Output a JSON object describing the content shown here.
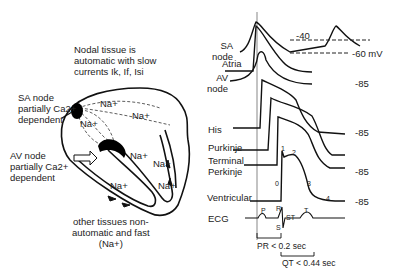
{
  "heart": {
    "nodal_note": [
      "Nodal tissue is",
      "automatic with slow",
      "currents Ik, If, Isi"
    ],
    "sa_label": [
      "SA node",
      "partially Ca2+",
      "dependent"
    ],
    "av_label": [
      "AV node",
      "partially Ca2+",
      "dependent"
    ],
    "na_labels": [
      "Na+",
      "Na+",
      "Na+",
      "Na+",
      "Na+",
      "Na+",
      "Na+"
    ],
    "other_note": [
      "other tissues non-",
      "automatic and fast",
      "(Na+)"
    ]
  },
  "traces": {
    "labels": {
      "sa": [
        "SA",
        "node"
      ],
      "atria": "Atria",
      "av": [
        "AV",
        "node"
      ],
      "his": "His",
      "purkinje": "Purkinje",
      "terminal": [
        "Terminal",
        "Perkinje"
      ],
      "ventricular": "Ventricular",
      "ecg": "ECG"
    },
    "voltages": {
      "threshold": "-40",
      "sa_rest": "-60 mV",
      "av_rest": "-85",
      "his_rest": "-85",
      "terminal_rest": "-85",
      "ventricular_rest": "-85"
    },
    "phases": [
      "0",
      "1",
      "2",
      "3",
      "4"
    ],
    "ecg_waves": [
      "P",
      "R",
      "S",
      "ST",
      "T"
    ],
    "intervals": {
      "pr": "PR < 0.2 sec",
      "qt": "QT < 0.44 sec"
    }
  }
}
